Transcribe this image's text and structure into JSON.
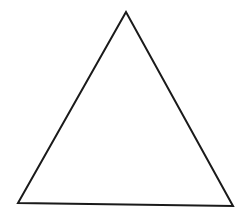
{
  "diagram": {
    "shape": "triangle",
    "background": "#ffffff",
    "stroke": "#1a1a1a",
    "stroke_width": 2,
    "fill": "none",
    "vertices": {
      "apex": [
        126,
        12
      ],
      "bottom_left": [
        18,
        203
      ],
      "bottom_right": [
        233,
        206
      ]
    }
  }
}
